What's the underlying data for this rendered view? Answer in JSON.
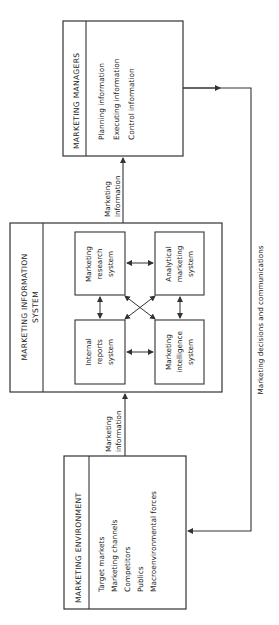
{
  "diagram": {
    "orientation": "rotated-90-ccw",
    "nodes": {
      "managers": {
        "title": "MARKETING MANAGERS",
        "items": [
          "Planning information",
          "Executing information",
          "Control information"
        ]
      },
      "mis": {
        "title_line1": "MARKETING INFORMATION",
        "title_line2": "SYSTEM",
        "subsystems": {
          "research": [
            "Marketing",
            "research",
            "system"
          ],
          "analytical": [
            "Analytical",
            "marketing",
            "system"
          ],
          "internal": [
            "Internal",
            "reports",
            "system"
          ],
          "intelligence": [
            "Marketing",
            "intelligence",
            "system"
          ]
        }
      },
      "environment": {
        "title": "MARKETING ENVIRONMENT",
        "items": [
          "Target markets",
          "Marketing channels",
          "Competitors",
          "Publics",
          "Macroenvironmental forces"
        ]
      }
    },
    "edges": {
      "env_to_mis": [
        "Marketing",
        "information"
      ],
      "mis_to_managers": [
        "Marketing",
        "information"
      ],
      "feedback": "Marketing decisions and communications"
    },
    "colors": {
      "line": "#333333",
      "text": "#222222",
      "background": "#ffffff"
    }
  }
}
